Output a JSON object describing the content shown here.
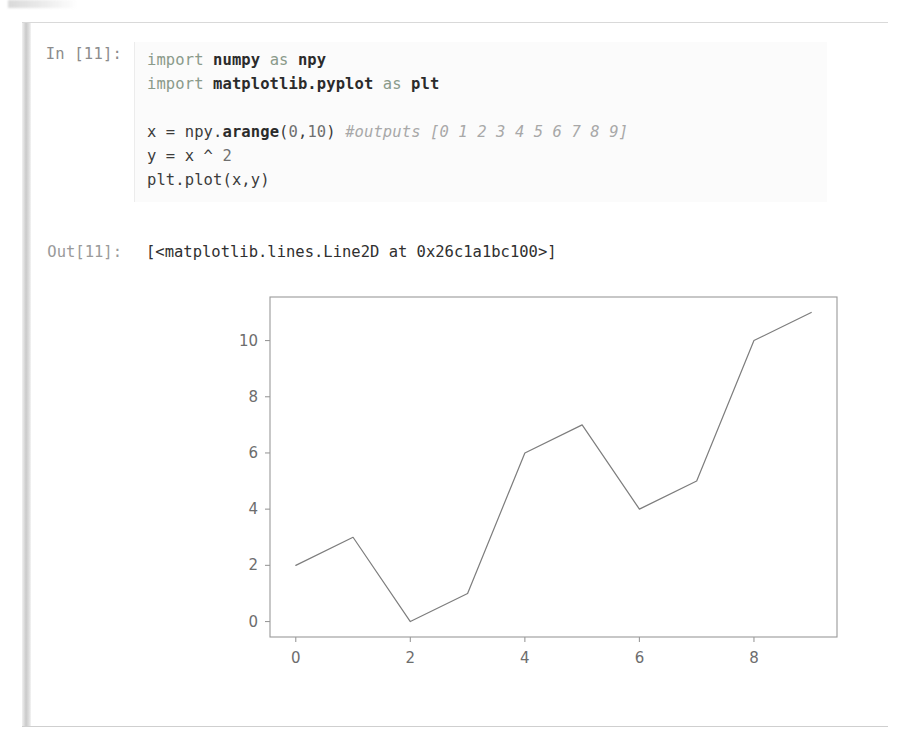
{
  "notebook": {
    "input": {
      "prompt_label": "In [11]:",
      "lines": [
        {
          "id": "line-1",
          "tokens": [
            {
              "type": "kw",
              "text": "import "
            },
            {
              "type": "mod",
              "text": "numpy"
            },
            {
              "type": "kw",
              "text": " as "
            },
            {
              "type": "mod",
              "text": "npy"
            }
          ]
        },
        {
          "id": "line-2",
          "tokens": [
            {
              "type": "kw",
              "text": "import "
            },
            {
              "type": "mod",
              "text": "matplotlib.pyplot"
            },
            {
              "type": "kw",
              "text": " as "
            },
            {
              "type": "mod",
              "text": "plt"
            }
          ]
        },
        {
          "id": "line-3",
          "tokens": []
        },
        {
          "id": "line-4",
          "tokens": [
            {
              "type": "plain",
              "text": "x = npy."
            },
            {
              "type": "mod",
              "text": "arange"
            },
            {
              "type": "plain",
              "text": "("
            },
            {
              "type": "num",
              "text": "0"
            },
            {
              "type": "plain",
              "text": ","
            },
            {
              "type": "num",
              "text": "10"
            },
            {
              "type": "plain",
              "text": ") "
            },
            {
              "type": "comment",
              "text": "#outputs [0 1 2 3 4 5 6 7 8 9]"
            }
          ]
        },
        {
          "id": "line-5",
          "tokens": [
            {
              "type": "plain",
              "text": "y = x ^ "
            },
            {
              "type": "num",
              "text": "2"
            }
          ]
        },
        {
          "id": "line-6",
          "tokens": [
            {
              "type": "plain",
              "text": "plt.plot(x,y)"
            }
          ]
        }
      ],
      "plain_text": "import numpy as npy\nimport matplotlib.pyplot as plt\n\nx = npy.arange(0,10) #outputs [0 1 2 3 4 5 6 7 8 9]\ny = x ^ 2\nplt.plot(x,y)"
    },
    "output": {
      "prompt_label": "Out[11]:",
      "text": "[<matplotlib.lines.Line2D at 0x26c1a1bc100>]"
    }
  },
  "colors": {
    "keyword": "#8a9a8a",
    "comment": "#a8a8a8",
    "prompt": "#8c8c8c",
    "code": "#2e2e2e",
    "plot_line": "#7d7d7d",
    "axis": "#9a9a9a"
  },
  "chart_data": {
    "type": "line",
    "title": "",
    "xlabel": "",
    "ylabel": "",
    "x": [
      0,
      1,
      2,
      3,
      4,
      5,
      6,
      7,
      8,
      9
    ],
    "values": [
      2,
      3,
      0,
      1,
      6,
      7,
      4,
      5,
      10,
      11
    ],
    "series": [
      {
        "name": "y = x ^ 2",
        "values": [
          2,
          3,
          0,
          1,
          6,
          7,
          4,
          5,
          10,
          11
        ]
      }
    ],
    "xticks": [
      0,
      2,
      4,
      6,
      8
    ],
    "yticks": [
      0,
      2,
      4,
      6,
      8,
      10
    ],
    "xtick_labels": [
      "0",
      "2",
      "4",
      "6",
      "8"
    ],
    "ytick_labels": [
      "0",
      "2",
      "4",
      "6",
      "8",
      "10"
    ],
    "xlim": [
      -0.45,
      9.45
    ],
    "ylim": [
      -0.55,
      11.55
    ],
    "grid": false,
    "legend": false,
    "line_color": "#7d7d7d",
    "line_width": 1.2
  }
}
